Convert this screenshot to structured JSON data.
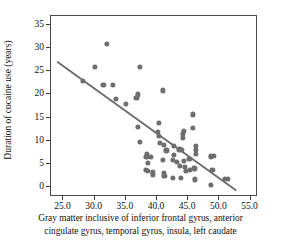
{
  "chart_data": {
    "type": "scatter",
    "title": "",
    "xlabel": "Gray matter inclusive of inferior frontal gyrus, anterior cingulate gyrus, temporal gyrus, insula, left caudate",
    "xlabel_line1": "Gray matter inclusive of inferior frontal gyrus, anterior",
    "xlabel_line2": "cingulate gyrus, temporal gyrus, insula, left caudate",
    "ylabel": "Duration of cocaine use (years)",
    "xlim": [
      23.0,
      56.2
    ],
    "ylim": [
      -2.2,
      37.0
    ],
    "xticks": [
      25.0,
      30.0,
      35.0,
      40.0,
      45.0,
      50.0,
      55.0
    ],
    "xticklabels": [
      "25.0",
      "30.0",
      "35.0",
      "40.0",
      "45.0",
      "50.0",
      "55.0"
    ],
    "yticks": [
      0,
      5,
      10,
      15,
      20,
      25,
      30,
      35
    ],
    "yticklabels": [
      "0",
      "5",
      "10",
      "15",
      "20",
      "25",
      "30",
      "35"
    ],
    "grid": false,
    "legend": null,
    "marker_color": "#6e6e6e",
    "line_color": "#6a6a6a",
    "frame_color": "#4a4a4a",
    "trendline": {
      "x0": 24.0,
      "y0": 27.0,
      "x1": 53.0,
      "y1": -1.2
    },
    "points": [
      [
        32.0,
        31.0
      ],
      [
        30.1,
        26.0
      ],
      [
        37.2,
        25.9
      ],
      [
        28.1,
        23.0
      ],
      [
        31.4,
        22.0
      ],
      [
        32.9,
        22.0
      ],
      [
        33.4,
        19.1
      ],
      [
        36.7,
        19.2
      ],
      [
        36.9,
        20.0
      ],
      [
        35.0,
        17.9
      ],
      [
        41.0,
        20.9
      ],
      [
        45.7,
        15.7
      ],
      [
        40.3,
        13.9
      ],
      [
        36.9,
        13.0
      ],
      [
        45.8,
        12.8
      ],
      [
        44.3,
        12.2
      ],
      [
        44.2,
        11.4
      ],
      [
        40.2,
        11.9
      ],
      [
        40.3,
        11.1
      ],
      [
        44.1,
        10.6
      ],
      [
        37.3,
        9.7
      ],
      [
        40.5,
        9.5
      ],
      [
        41.1,
        9.0
      ],
      [
        42.7,
        8.9
      ],
      [
        43.6,
        8.1
      ],
      [
        44.0,
        8.0
      ],
      [
        46.2,
        8.8
      ],
      [
        46.3,
        8.0
      ],
      [
        46.2,
        7.2
      ],
      [
        41.5,
        7.9
      ],
      [
        42.7,
        7.0
      ],
      [
        38.4,
        7.1
      ],
      [
        38.3,
        6.4
      ],
      [
        39.0,
        6.4
      ],
      [
        41.0,
        5.9
      ],
      [
        42.6,
        5.9
      ],
      [
        43.2,
        5.4
      ],
      [
        44.3,
        5.6
      ],
      [
        45.2,
        6.0
      ],
      [
        48.7,
        6.6
      ],
      [
        49.1,
        6.7
      ],
      [
        38.5,
        5.2
      ],
      [
        43.7,
        4.5
      ],
      [
        44.5,
        4.3
      ],
      [
        44.6,
        3.5
      ],
      [
        45.3,
        3.6
      ],
      [
        46.0,
        4.0
      ],
      [
        38.2,
        3.6
      ],
      [
        38.6,
        3.5
      ],
      [
        39.4,
        3.2
      ],
      [
        39.3,
        2.7
      ],
      [
        41.1,
        3.0
      ],
      [
        41.2,
        2.3
      ],
      [
        42.6,
        1.9
      ],
      [
        43.9,
        2.0
      ],
      [
        46.1,
        1.6
      ],
      [
        48.9,
        3.6
      ],
      [
        50.9,
        1.7
      ],
      [
        51.4,
        1.7
      ],
      [
        48.7,
        0.5
      ]
    ]
  }
}
